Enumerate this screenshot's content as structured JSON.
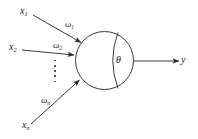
{
  "diagram": {
    "type": "neuron-schematic",
    "stroke_color": "#3a3a3a",
    "text_color": "#1a1a1a",
    "background_color": "#ffffff",
    "inputs": [
      {
        "signal": "x",
        "signal_sub": "1",
        "weight": "ω",
        "weight_sub": "1"
      },
      {
        "signal": "x",
        "signal_sub": "2",
        "weight": "ω",
        "weight_sub": "2"
      },
      {
        "signal": "x",
        "signal_sub": "n",
        "weight": "ω",
        "weight_sub": "n"
      }
    ],
    "ellipsis": "⋮",
    "body": {
      "threshold_symbol": "θ"
    },
    "output": {
      "label": "y"
    }
  },
  "geometry": {
    "soma": {
      "cx": 104.5,
      "cy": 60.5,
      "r": 29
    },
    "inner_arc": "M 118 32.5 Q 108 60.5 118 88.5",
    "arrows": [
      {
        "x1": 33,
        "y1": 15,
        "x2": 82,
        "y2": 43
      },
      {
        "x1": 22,
        "y1": 50,
        "x2": 75,
        "y2": 55
      },
      {
        "x1": 31,
        "y1": 124,
        "x2": 80,
        "y2": 80
      }
    ],
    "output_arrow": {
      "x1": 133,
      "y1": 61,
      "x2": 180,
      "y2": 61
    }
  }
}
